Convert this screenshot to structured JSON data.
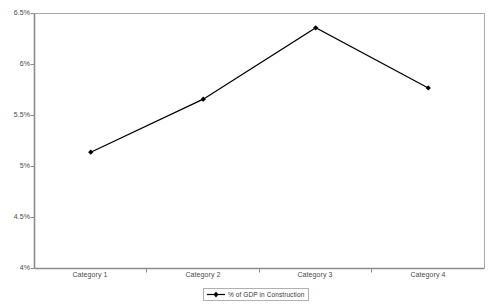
{
  "chart_data": {
    "type": "line",
    "title": "",
    "subtitle": "",
    "xlabel": "",
    "ylabel": "",
    "categories": [
      "Category 1",
      "Category 2",
      "Category 3",
      "Category 4"
    ],
    "series": [
      {
        "name": "% of GDP in Construction",
        "values": [
          5.14,
          5.66,
          6.36,
          5.77
        ],
        "color": "#000000",
        "marker": "diamond"
      }
    ],
    "ylim": [
      4.0,
      6.5
    ],
    "ytick_values": [
      6.5,
      6.0,
      5.5,
      5.0,
      4.5,
      4.0
    ],
    "ytick_labels": [
      "6.5%",
      "6%",
      "5.5%",
      "5%",
      "4.5%",
      "4%"
    ],
    "grid": false,
    "legend_position": "bottom",
    "legend_entries": [
      "% of GDP in Construction"
    ],
    "annotations": []
  },
  "legend": {
    "entry_label": "% of GDP in Construction",
    "symbol_icon": "line-marker-icon"
  },
  "axes": {
    "axis_color": "#808080",
    "tick_color": "#808080",
    "label_color": "#4a4a4a"
  }
}
